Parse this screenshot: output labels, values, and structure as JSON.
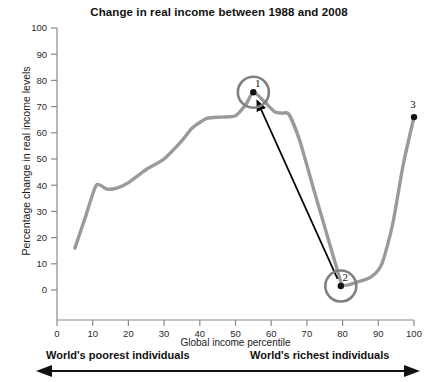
{
  "chart_data": {
    "type": "line",
    "title": "Change in real income between 1988 and 2008",
    "xlabel": "Global income percentile",
    "ylabel": "Percentage change in real income levels",
    "xlim": [
      0,
      100
    ],
    "ylim": [
      0,
      100
    ],
    "grid": false,
    "legend": null,
    "xticks": [
      "0",
      "10",
      "20",
      "30",
      "40",
      "50",
      "60",
      "70",
      "80",
      "90",
      "100"
    ],
    "yticks": [
      "0",
      "10",
      "20",
      "30",
      "40",
      "50",
      "60",
      "70",
      "80",
      "90",
      "100"
    ],
    "x": [
      5,
      8,
      11,
      14,
      17,
      20,
      25,
      30,
      35,
      38,
      42,
      46,
      50,
      53,
      55,
      58,
      61,
      63,
      65,
      68,
      72,
      75,
      78,
      80,
      84,
      88,
      91,
      94,
      97,
      100
    ],
    "values": [
      16,
      28,
      40,
      38.5,
      39,
      41,
      46,
      50,
      57,
      62,
      65.5,
      66,
      66.5,
      71,
      75.5,
      72,
      68,
      67.5,
      67,
      57,
      38,
      24,
      10,
      2,
      3,
      5,
      10,
      25,
      48,
      66
    ],
    "series_color": "#9a9a9a",
    "annotations": [
      {
        "id": "1",
        "label": "1",
        "x": 55,
        "y": 75.5,
        "circled": true
      },
      {
        "id": "2",
        "label": "2",
        "x": 79.5,
        "y": 1.5,
        "circled": true
      },
      {
        "id": "3",
        "label": "3",
        "x": 100,
        "y": 66,
        "circled": false
      }
    ],
    "arrow": {
      "from_marker": "2",
      "to_marker": "1",
      "color": "#000000"
    }
  },
  "axis_annotations": {
    "left_text": "World's poorest individuals",
    "right_text": "World's richest individuals",
    "arrow_name": "double-headed-range-arrow"
  }
}
